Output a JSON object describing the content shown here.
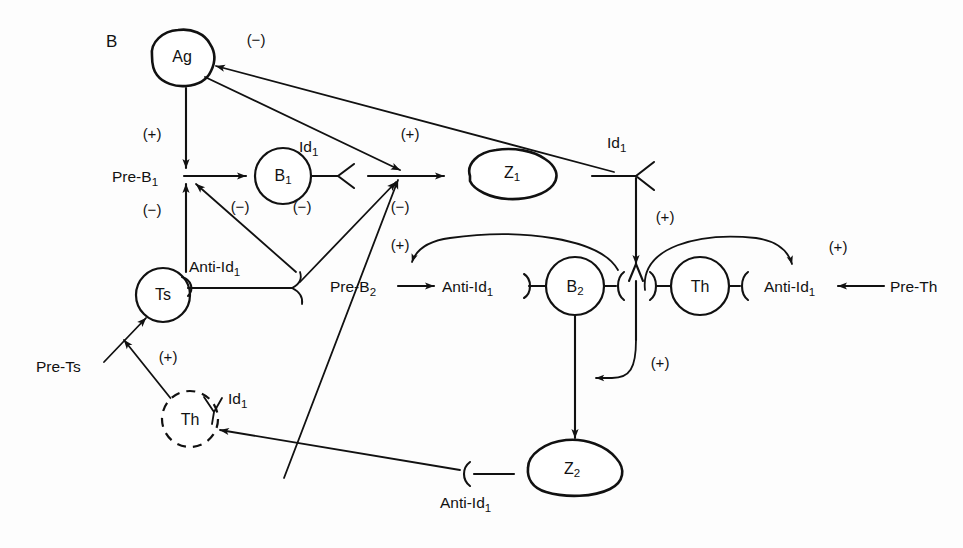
{
  "figure": {
    "panel_label": "B",
    "background_color": "#fdfdfd",
    "ink_color": "#111111"
  },
  "nodes": {
    "ag": "Ag",
    "pre_b1": "Pre-B",
    "pre_b1_sub": "1",
    "b1": "B",
    "b1_sub": "1",
    "z1": "Z",
    "z1_sub": "1",
    "ts": "Ts",
    "pre_ts": "Pre-Ts",
    "th_dashed": "Th",
    "pre_b2": "Pre-B",
    "pre_b2_sub": "2",
    "b2": "B",
    "b2_sub": "2",
    "th_right": "Th",
    "pre_th": "Pre-Th",
    "z2": "Z",
    "z2_sub": "2"
  },
  "receptors": {
    "id1_b1": "Id",
    "id1_b1_sub": "1",
    "id1_right": "Id",
    "id1_right_sub": "1",
    "id1_th_dashed": "Id",
    "id1_th_dashed_sub": "1",
    "anti_id1_ts": "Anti-Id",
    "anti_id1_ts_sub": "1",
    "anti_id1_b2": "Anti-Id",
    "anti_id1_b2_sub": "1",
    "anti_id1_th": "Anti-Id",
    "anti_id1_th_sub": "1",
    "anti_id1_bottom": "Anti-Id",
    "anti_id1_bottom_sub": "1"
  },
  "signs": {
    "ag_to_id1_right": "(−)",
    "ag_to_pre_b1": "(+)",
    "ag_to_junction": "(+)",
    "ts_to_pre_b1": "(−)",
    "anti_id1_to_pre_b1": "(−)",
    "b1_to_junction": "(−)",
    "junction_minus": "(−)",
    "id1_to_complex": "(+)",
    "b2_arc_plus": "(+)",
    "th_arc_plus": "(+)",
    "complex_to_z2_plus": "(+)",
    "th_dashed_to_ts": "(+)"
  },
  "edges": [
    {
      "from": "Ag",
      "to": "Pre-B1",
      "sign": "(+)"
    },
    {
      "from": "Id1 (right)",
      "to": "Ag",
      "sign": "(−)"
    },
    {
      "from": "Ag",
      "to": "junction",
      "sign": "(+)"
    },
    {
      "from": "Pre-B1",
      "to": "B1",
      "sign": ""
    },
    {
      "from": "Ts",
      "to": "Pre-B1",
      "sign": "(−)"
    },
    {
      "from": "Anti-Id1 (Ts)",
      "to": "Pre-B1",
      "sign": "(−)"
    },
    {
      "from": "B1",
      "to": "Z1",
      "sign": ""
    },
    {
      "from": "Anti-Id1 (bottom)",
      "to": "junction",
      "sign": "(−)"
    },
    {
      "from": "Id1 (right)",
      "to": "B2-Th complex",
      "sign": "(+)"
    },
    {
      "from": "Pre-B2",
      "to": "Anti-Id1 (B2)",
      "sign": ""
    },
    {
      "from": "complex",
      "to": "Pre-B2 / Anti-Id1",
      "sign": "(+)"
    },
    {
      "from": "Pre-Th",
      "to": "Anti-Id1 (Th)",
      "sign": ""
    },
    {
      "from": "complex",
      "to": "Anti-Id1 (Th)",
      "sign": "(+)"
    },
    {
      "from": "B2",
      "to": "Z2",
      "sign": ""
    },
    {
      "from": "complex",
      "to": "B2-Z2 line",
      "sign": "(+)"
    },
    {
      "from": "Pre-Ts",
      "to": "Ts",
      "sign": ""
    },
    {
      "from": "Th (dashed)",
      "to": "Ts",
      "sign": "(+)"
    },
    {
      "from": "Anti-Id1 (bottom)",
      "to": "Th (dashed)",
      "sign": ""
    }
  ]
}
